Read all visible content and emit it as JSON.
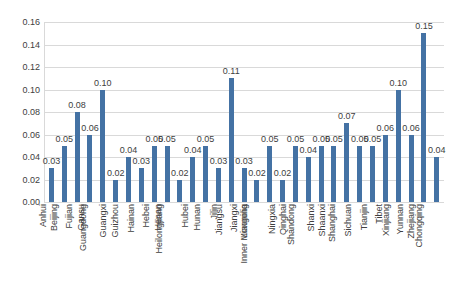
{
  "chart_data": {
    "type": "bar",
    "title": "",
    "subtitle": "",
    "xlabel": "",
    "ylabel": "",
    "ylim": [
      0.0,
      0.16
    ],
    "ytick_step": 0.02,
    "ytick_labels": [
      "0.16",
      "0.14",
      "0.12",
      "0.10",
      "0.08",
      "0.06",
      "0.04",
      "0.02",
      "0.00"
    ],
    "ytick_values": [
      0.16,
      0.14,
      0.12,
      0.1,
      0.08,
      0.06,
      0.04,
      0.02,
      0.0
    ],
    "grid": true,
    "legend": "none",
    "series_color": "#4472A4",
    "categories": [
      "Anhui",
      "Beijing",
      "Fujian",
      "Gansu",
      "Guangdong",
      "Guangxi",
      "Guizhou",
      "Hainan",
      "Hebei",
      "Henan",
      "Heilongjiang",
      "Hubei",
      "Hunan",
      "Jilin",
      "Jiangsu",
      "Jiangxi",
      "Liaoning",
      "Inner Mongolia",
      "Ningxia",
      "Qinghai",
      "Shandong",
      "Shanxi",
      "Shaanxi",
      "Shanghai",
      "Sichuan",
      "Tianjin",
      "Tibet",
      "Xinjiang",
      "Yunnan",
      "Zhejiang",
      "Chongqing"
    ],
    "values": [
      0.03,
      0.05,
      0.08,
      0.06,
      0.1,
      0.02,
      0.04,
      0.03,
      0.05,
      0.05,
      0.02,
      0.04,
      0.05,
      0.03,
      0.11,
      0.03,
      0.02,
      0.05,
      0.02,
      0.05,
      0.04,
      0.05,
      0.05,
      0.07,
      0.05,
      0.05,
      0.06,
      0.1,
      0.06,
      0.15,
      0.04
    ],
    "data_labels": [
      "0.03",
      "0.05",
      "0.08",
      "0.06",
      "0.10",
      "0.02",
      "0.04",
      "0.03",
      "0.05",
      "0.05",
      "0.02",
      "0.04",
      "0.05",
      "0.03",
      "0.11",
      "0.03",
      "0.02",
      "0.05",
      "0.02",
      "0.05",
      "0.04",
      "0.05",
      "0.05",
      "0.07",
      "0.05",
      "0.05",
      "0.06",
      "0.10",
      "0.06",
      "0.15",
      "0.04"
    ]
  }
}
